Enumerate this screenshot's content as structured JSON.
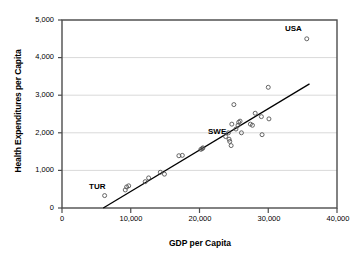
{
  "chart_data": {
    "type": "scatter",
    "title": "",
    "xlabel": "GDP per Capita",
    "ylabel": "Health Expenditures per Capita",
    "xlim": [
      0,
      40000
    ],
    "ylim": [
      0,
      5000
    ],
    "xticks": [
      0,
      10000,
      20000,
      30000,
      40000
    ],
    "xticklabels": [
      "0",
      "10,000",
      "20,000",
      "30,000",
      "40,000"
    ],
    "yticks": [
      0,
      1000,
      2000,
      3000,
      4000,
      5000
    ],
    "yticklabels": [
      "0",
      "1,000",
      "2,000",
      "3,000",
      "4,000",
      "5,000"
    ],
    "grid": "horizontal",
    "legend": "none",
    "marker": "open-circle",
    "points": [
      {
        "x": 6200,
        "y": 330
      },
      {
        "x": 9200,
        "y": 480
      },
      {
        "x": 9400,
        "y": 560
      },
      {
        "x": 9700,
        "y": 590
      },
      {
        "x": 12100,
        "y": 700
      },
      {
        "x": 12600,
        "y": 800
      },
      {
        "x": 14300,
        "y": 950
      },
      {
        "x": 14900,
        "y": 900
      },
      {
        "x": 17000,
        "y": 1390
      },
      {
        "x": 17500,
        "y": 1400
      },
      {
        "x": 20200,
        "y": 1560
      },
      {
        "x": 20400,
        "y": 1580
      },
      {
        "x": 20500,
        "y": 1600
      },
      {
        "x": 23800,
        "y": 1900
      },
      {
        "x": 24200,
        "y": 2000
      },
      {
        "x": 24300,
        "y": 1830
      },
      {
        "x": 24400,
        "y": 1770
      },
      {
        "x": 24600,
        "y": 1660
      },
      {
        "x": 24700,
        "y": 2230
      },
      {
        "x": 25000,
        "y": 2750
      },
      {
        "x": 25300,
        "y": 2100
      },
      {
        "x": 25600,
        "y": 2200
      },
      {
        "x": 25700,
        "y": 2280
      },
      {
        "x": 25900,
        "y": 2310
      },
      {
        "x": 26100,
        "y": 2000
      },
      {
        "x": 27400,
        "y": 2230
      },
      {
        "x": 27700,
        "y": 2200
      },
      {
        "x": 28100,
        "y": 2520
      },
      {
        "x": 29000,
        "y": 2430
      },
      {
        "x": 29100,
        "y": 1950
      },
      {
        "x": 30000,
        "y": 3210
      },
      {
        "x": 30100,
        "y": 2370
      },
      {
        "x": 35600,
        "y": 4500
      }
    ],
    "trendline": {
      "x0": 6000,
      "y0": 0,
      "x1": 36000,
      "y1": 3300
    },
    "annotations": [
      {
        "label": "USA",
        "x": 35600,
        "y": 4500
      },
      {
        "label": "SWE",
        "x": 24200,
        "y": 2000
      },
      {
        "label": "TUR",
        "x": 6200,
        "y": 330
      }
    ]
  },
  "axis": {
    "y_title": "Health Expenditures per Capita",
    "x_title": "GDP per Capita",
    "y_labels": [
      "5,000",
      "4,000",
      "3,000",
      "2,000",
      "1,000",
      "0"
    ],
    "x_labels": [
      "0",
      "10,000",
      "20,000",
      "30,000",
      "40,000"
    ]
  },
  "annotation_labels": {
    "usa": "USA",
    "swe": "SWE",
    "tur": "TUR"
  },
  "colors": {
    "frame": "#4d4d4d",
    "grid": "#d9d9d9",
    "marker_stroke": "#555555",
    "trendline": "#000000",
    "text": "#000000",
    "background": "#ffffff"
  }
}
